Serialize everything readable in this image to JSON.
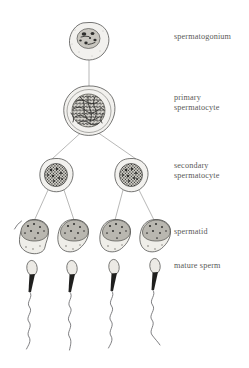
{
  "figure": {
    "background_color": "#ffffff",
    "width": 249,
    "height": 368,
    "line_color": "#9a9a98",
    "outline_color": "#4a4a48",
    "chromatin_color": "#2e2e2c",
    "label_color": "#5a5a58"
  },
  "labels": [
    {
      "id": "spermatogonium",
      "text": "spermatogonium",
      "x": 174,
      "y": 39,
      "lines": [
        "spermatogonium"
      ]
    },
    {
      "id": "primary-spermatocyte",
      "text": "primary spermatocyte",
      "x": 174,
      "y": 100,
      "lines": [
        "primary",
        "spermatocyte"
      ]
    },
    {
      "id": "secondary-spermatocyte",
      "text": "secondary spermatocyte",
      "x": 174,
      "y": 168,
      "lines": [
        "secondary",
        "spermatocyte"
      ]
    },
    {
      "id": "spermatid",
      "text": "spermatid",
      "x": 174,
      "y": 233,
      "lines": [
        "spermatid"
      ]
    },
    {
      "id": "mature-sperm",
      "text": "mature sperm",
      "x": 174,
      "y": 268,
      "lines": [
        "mature sperm"
      ]
    }
  ],
  "label_lines": {
    "spermatogonium": "spermatogonium",
    "primary_1": "primary",
    "primary_2": "spermatocyte",
    "secondary_1": "secondary",
    "secondary_2": "spermatocyte",
    "spermatid": "spermatid",
    "mature_sperm": "mature sperm"
  },
  "stages": [
    {
      "name": "spermatogonium",
      "count": 1,
      "cells": [
        {
          "cx": 89,
          "cy": 41,
          "rx": 20,
          "ry": 19
        }
      ]
    },
    {
      "name": "primary spermatocyte",
      "count": 1,
      "cells": [
        {
          "cx": 89,
          "cy": 111,
          "rx": 26,
          "ry": 25
        }
      ]
    },
    {
      "name": "secondary spermatocyte",
      "count": 2,
      "cells": [
        {
          "cx": 56,
          "cy": 175,
          "rx": 17,
          "ry": 17
        },
        {
          "cx": 131,
          "cy": 175,
          "rx": 17,
          "ry": 17
        }
      ]
    },
    {
      "name": "spermatid",
      "count": 4,
      "cells": [
        {
          "cx": 33,
          "cy": 235
        },
        {
          "cx": 73,
          "cy": 235
        },
        {
          "cx": 115,
          "cy": 235
        },
        {
          "cx": 155,
          "cy": 235
        }
      ]
    },
    {
      "name": "mature sperm",
      "count": 4,
      "cells": [
        {
          "cx": 33,
          "cy": 270
        },
        {
          "cx": 73,
          "cy": 270
        },
        {
          "cx": 115,
          "cy": 270
        },
        {
          "cx": 155,
          "cy": 270
        }
      ]
    }
  ],
  "connections": [
    {
      "from": "spermatogonium",
      "to": "primary spermatocyte",
      "x1": 89,
      "y1": 60,
      "x2": 89,
      "y2": 86
    },
    {
      "from": "primary spermatocyte",
      "to": "secondary spermatocyte left",
      "x1": 80,
      "y1": 133,
      "x2": 52,
      "y2": 159
    },
    {
      "from": "primary spermatocyte",
      "to": "secondary spermatocyte right",
      "x1": 99,
      "y1": 133,
      "x2": 136,
      "y2": 159
    },
    {
      "from": "secondary spermatocyte left",
      "to": "spermatid 1",
      "x1": 47,
      "y1": 190,
      "x2": 34,
      "y2": 219
    },
    {
      "from": "secondary spermatocyte left",
      "to": "spermatid 2",
      "x1": 64,
      "y1": 190,
      "x2": 74,
      "y2": 219
    },
    {
      "from": "secondary spermatocyte right",
      "to": "spermatid 3",
      "x1": 123,
      "y1": 190,
      "x2": 115,
      "y2": 219
    },
    {
      "from": "secondary spermatocyte right",
      "to": "spermatid 4",
      "x1": 140,
      "y1": 190,
      "x2": 155,
      "y2": 219
    }
  ]
}
